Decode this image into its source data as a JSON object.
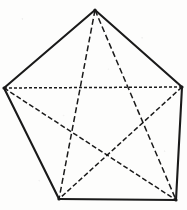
{
  "figure": {
    "kind": "geometry-diagram",
    "name": "Regular pentagon with all five diagonals",
    "canvas": {
      "width": 187,
      "height": 210
    },
    "background_color": "#fdfdfc",
    "ink_color": "#1a1a1a"
  },
  "vertices": [
    {
      "id": "top",
      "label": "A",
      "x": 95,
      "y": 10
    },
    {
      "id": "right",
      "label": "B",
      "x": 182,
      "y": 87
    },
    {
      "id": "bottom-right",
      "label": "C",
      "x": 176,
      "y": 200
    },
    {
      "id": "bottom-left",
      "label": "D",
      "x": 59,
      "y": 199
    },
    {
      "id": "left",
      "label": "E",
      "x": 4,
      "y": 88
    }
  ],
  "edges": [
    {
      "id": "edge-top-right",
      "from": "top",
      "to": "right",
      "style": "solid",
      "stroke_width": 2.1
    },
    {
      "id": "edge-right-bottomright",
      "from": "right",
      "to": "bottom-right",
      "style": "solid",
      "stroke_width": 2.1
    },
    {
      "id": "edge-bottomright-bottomleft",
      "from": "bottom-right",
      "to": "bottom-left",
      "style": "solid",
      "stroke_width": 2.1
    },
    {
      "id": "edge-bottomleft-left",
      "from": "bottom-left",
      "to": "left",
      "style": "solid",
      "stroke_width": 2.1
    },
    {
      "id": "edge-left-top",
      "from": "left",
      "to": "top",
      "style": "solid",
      "stroke_width": 2.1
    }
  ],
  "diagonals": [
    {
      "id": "diag-top-bottomleft",
      "from": "top",
      "to": "bottom-left",
      "style": "dashed",
      "dash_pattern": "6 3",
      "stroke_width": 1.5
    },
    {
      "id": "diag-top-bottomright",
      "from": "top",
      "to": "bottom-right",
      "style": "dashed",
      "dash_pattern": "6 3",
      "stroke_width": 1.5
    },
    {
      "id": "diag-left-right",
      "from": "left",
      "to": "right",
      "style": "dotted",
      "dash_pattern": "3 2",
      "stroke_width": 1.5
    },
    {
      "id": "diag-left-bottomright",
      "from": "left",
      "to": "bottom-right",
      "style": "dashed",
      "dash_pattern": "5 2.5",
      "stroke_width": 1.5
    },
    {
      "id": "diag-right-bottomleft",
      "from": "right",
      "to": "bottom-left",
      "style": "dashed",
      "dash_pattern": "5 2.5",
      "stroke_width": 1.5
    }
  ]
}
